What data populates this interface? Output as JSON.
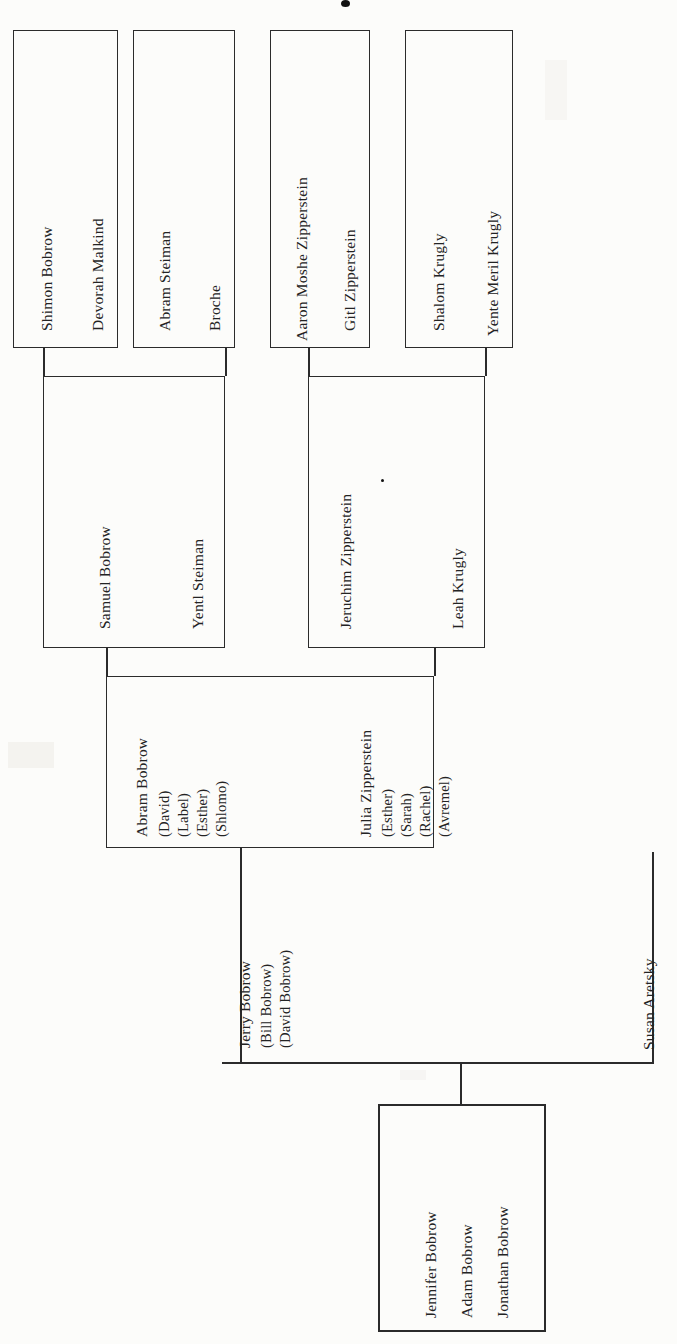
{
  "document": {
    "kind": "family-tree-chart",
    "orientation": "rotated-90-counterclockwise"
  },
  "generation1": {
    "label": "great-grandparents",
    "boxes": [
      {
        "id": "bobrow-malkind",
        "names": [
          "Shimon Bobrow",
          "Devorah Malkind"
        ]
      },
      {
        "id": "steiman-broche",
        "names": [
          "Abram Steiman",
          "Broche"
        ]
      },
      {
        "id": "zipperstein-gitl",
        "names": [
          "Aaron Moshe Zipperstein",
          "Gitl Zipperstein"
        ]
      },
      {
        "id": "krugly-yente",
        "names": [
          "Shalom Krugly",
          "Yente Meril Krugly"
        ]
      }
    ]
  },
  "generation2": {
    "label": "grandparents",
    "boxes": [
      {
        "id": "samuel-yentl",
        "names": [
          "Samuel Bobrow",
          "Yentl Steiman"
        ]
      },
      {
        "id": "jeruchim-leah",
        "names": [
          "Jeruchim  Zipperstein",
          "Leah Krugly"
        ]
      }
    ]
  },
  "generation3": {
    "label": "parents",
    "box": {
      "id": "abram-julia",
      "left_person": {
        "name": "Abram Bobrow",
        "siblings": [
          "(David)",
          "(Label)",
          "(Esther)",
          "(Shlomo)"
        ]
      },
      "right_person": {
        "name": "Julia Zipperstein",
        "siblings": [
          "(Esther)",
          "(Sarah)",
          "(Rachel)",
          "(Avremel)"
        ]
      }
    }
  },
  "generation4": {
    "label": "couple",
    "husband": {
      "name": "Jerry Bobrow",
      "siblings": [
        "(Bill Bobrow)",
        "(David Bobrow)"
      ]
    },
    "wife": {
      "name": "Susan Aretsky"
    }
  },
  "generation5": {
    "label": "children",
    "box": {
      "id": "children",
      "names": [
        "Jennifer Bobrow",
        "Adam Bobrow",
        "Jonathan Bobrow"
      ]
    }
  },
  "ink": {
    "stroke": "#2b2b2b",
    "text": "#232323",
    "paper": "#fcfcfa"
  }
}
